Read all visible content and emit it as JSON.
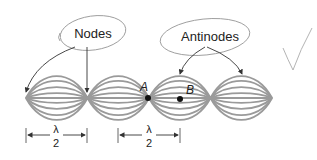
{
  "callouts": {
    "nodes_label": "Nodes",
    "antinodes_label": "Antinodes"
  },
  "points": {
    "a_label": "A",
    "b_label": "B"
  },
  "dimensions": [
    {
      "numerator": "λ",
      "denominator": "2"
    },
    {
      "numerator": "λ",
      "denominator": "2"
    }
  ],
  "wave": {
    "loops": 4,
    "amplitudes": [
      1.0,
      0.78,
      0.5,
      0.22
    ],
    "color": "#9a9a9a"
  },
  "annotation": {
    "checkmark": "✓"
  }
}
